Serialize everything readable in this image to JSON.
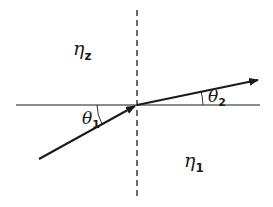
{
  "diagram": {
    "type": "refraction",
    "regions": {
      "upper": {
        "symbol": "η",
        "subscript": "z"
      },
      "lower": {
        "symbol": "η",
        "subscript": "1"
      }
    },
    "angles": {
      "incident": {
        "symbol": "θ",
        "subscript": "1"
      },
      "refracted": {
        "symbol": "θ",
        "subscript": "2"
      }
    },
    "colors": {
      "line": "#1a1a1a",
      "background": "#ffffff"
    }
  }
}
